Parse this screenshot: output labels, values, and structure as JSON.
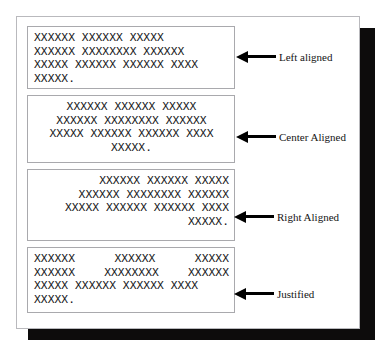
{
  "document": {
    "title": "Text Alignment Illustration",
    "page_background": "#ffffff",
    "shadow_color": "#0d0c0c",
    "border_color": "#b9b9bd",
    "text_color": "#17171a"
  },
  "paragraph_lines": {
    "line1_words": [
      "XXXXXX",
      "XXXXXX",
      "XXXXX"
    ],
    "line2_words": [
      "XXXXXX",
      "XXXXXXXX",
      "XXXXXX"
    ],
    "line3_words": [
      "XXXXX",
      "XXXXXX",
      "XXXXXX",
      "XXXX"
    ],
    "line4_words": [
      "XXXXX."
    ],
    "line1": "XXXXXX XXXXXX XXXXX",
    "line2": "XXXXXX XXXXXXXX XXXXXX",
    "line3": "XXXXX XXXXXX XXXXXX XXXX",
    "line4": "XXXXX."
  },
  "boxes": [
    {
      "id": "left-aligned",
      "alignment": "left",
      "label": "Left aligned",
      "lines": [
        "XXXXXX XXXXXX XXXXX",
        "XXXXXX XXXXXXXX XXXXXX",
        "XXXXX XXXXXX XXXXXX XXXX",
        "XXXXX."
      ]
    },
    {
      "id": "center-aligned",
      "alignment": "center",
      "label": "Center Aligned",
      "lines": [
        "XXXXXX XXXXXX XXXXX",
        "XXXXXX XXXXXXXX XXXXXX",
        "XXXXX XXXXXX XXXXXX XXXX",
        "XXXXX."
      ]
    },
    {
      "id": "right-aligned",
      "alignment": "right",
      "label": "Right Aligned",
      "lines": [
        "XXXXXX XXXXXX XXXXX",
        "XXXXXX XXXXXXXX XXXXXX",
        "XXXXX XXXXXX XXXXXX XXXX",
        "XXXXX."
      ]
    },
    {
      "id": "justified",
      "alignment": "justify",
      "label": "Justified",
      "lines": [
        "XXXXXX XXXXXX XXXXX",
        "XXXXXX XXXXXXXX XXXXXX",
        "XXXXX XXXXXX XXXXXX XXXX",
        "XXXXX."
      ]
    }
  ]
}
